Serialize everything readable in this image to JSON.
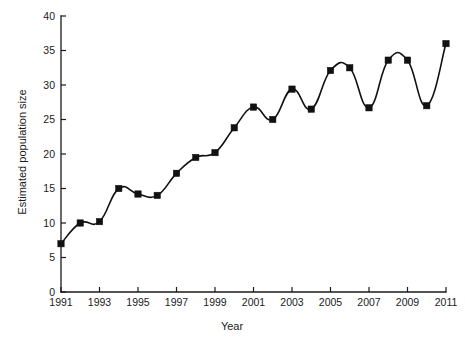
{
  "chart_data": {
    "type": "line",
    "title": "",
    "xlabel": "Year",
    "ylabel": "Estimated population size",
    "x": [
      1991,
      1992,
      1993,
      1994,
      1995,
      1996,
      1997,
      1998,
      1999,
      2000,
      2001,
      2002,
      2003,
      2004,
      2005,
      2006,
      2007,
      2008,
      2009,
      2010,
      2011
    ],
    "values": [
      7.0,
      10.0,
      10.2,
      15.0,
      14.2,
      14.0,
      17.2,
      19.5,
      20.2,
      23.8,
      26.8,
      25.0,
      29.4,
      26.5,
      32.1,
      32.5,
      26.7,
      33.6,
      33.6,
      27.0,
      36.0
    ],
    "series": [
      {
        "name": "Estimated population size",
        "values": [
          7.0,
          10.0,
          10.2,
          15.0,
          14.2,
          14.0,
          17.2,
          19.5,
          20.2,
          23.8,
          26.8,
          25.0,
          29.4,
          26.5,
          32.1,
          32.5,
          26.7,
          33.6,
          33.6,
          27.0,
          36.0
        ]
      }
    ],
    "xlim": [
      1991,
      2011
    ],
    "ylim": [
      0,
      40
    ],
    "xticks": [
      1991,
      1993,
      1995,
      1997,
      1999,
      2001,
      2003,
      2005,
      2007,
      2009,
      2011
    ],
    "xtick_labels": [
      "1991",
      "1993",
      "1995",
      "1997",
      "1999",
      "2001",
      "2003",
      "2005",
      "2007",
      "2009",
      "2011"
    ],
    "yticks": [
      0,
      5,
      10,
      15,
      20,
      25,
      30,
      35,
      40
    ],
    "ytick_labels": [
      "0",
      "5",
      "10",
      "15",
      "20",
      "25",
      "30",
      "35",
      "40"
    ],
    "grid": false,
    "legend": false,
    "legend_position": "none",
    "marker": "square",
    "line_color": "#111111",
    "marker_color": "#111111",
    "background_color": "#ffffff"
  }
}
